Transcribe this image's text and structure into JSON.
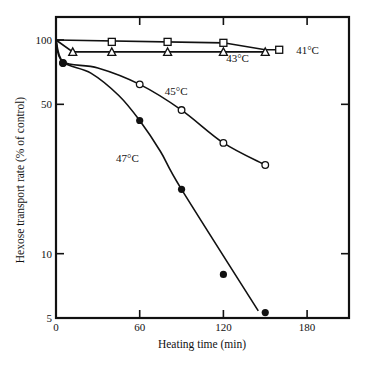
{
  "chart_data": {
    "type": "line",
    "title": "",
    "xlabel": "Heating time (min)",
    "ylabel": "Hexose transport rate (% of control)",
    "xscale": "linear",
    "yscale": "log",
    "xlim": [
      0,
      210
    ],
    "ylim": [
      5,
      130
    ],
    "x_ticks": [
      0,
      60,
      120,
      180
    ],
    "y_ticks": [
      5,
      10,
      50,
      100
    ],
    "x_tick_labels": [
      "0",
      "60",
      "120",
      "180"
    ],
    "y_tick_labels": [
      "5",
      "10",
      "50",
      "100"
    ],
    "grid": false,
    "legend": "inline labels next to curves",
    "series": [
      {
        "name": "41°C",
        "marker": "open-square",
        "x": [
          0,
          40,
          80,
          120,
          160
        ],
        "values": [
          100,
          98,
          98,
          97,
          90
        ],
        "line_points": [
          [
            0,
            100
          ],
          [
            120,
            97
          ],
          [
            150,
            90
          ],
          [
            160,
            90
          ]
        ]
      },
      {
        "name": "43°C",
        "marker": "open-triangle",
        "x": [
          0,
          12,
          40,
          80,
          120,
          150
        ],
        "values": [
          100,
          88,
          88,
          88,
          88,
          88
        ],
        "line_points": [
          [
            0,
            100
          ],
          [
            12,
            88
          ],
          [
            150,
            88
          ]
        ]
      },
      {
        "name": "45°C",
        "marker": "open-circle",
        "x": [
          5,
          60,
          90,
          120,
          150
        ],
        "values": [
          78,
          62,
          47,
          33,
          26
        ],
        "line_points": [
          [
            0,
            100
          ],
          [
            5,
            79
          ],
          [
            30,
            74
          ],
          [
            60,
            62
          ],
          [
            90,
            47
          ],
          [
            120,
            33
          ],
          [
            150,
            26
          ]
        ]
      },
      {
        "name": "47°C",
        "marker": "filled-circle",
        "x": [
          5,
          60,
          90,
          120,
          150
        ],
        "values": [
          78,
          42,
          20,
          8,
          5.3
        ],
        "line_points": [
          [
            0,
            100
          ],
          [
            5,
            79
          ],
          [
            25,
            70
          ],
          [
            45,
            55
          ],
          [
            60,
            42
          ],
          [
            75,
            30
          ],
          [
            90,
            20
          ],
          [
            145,
            5.4
          ]
        ]
      }
    ],
    "annotations": [
      {
        "text": "41°C",
        "x": 165,
        "y": 90
      },
      {
        "text": "43°C",
        "x": 122,
        "y": 82
      },
      {
        "text": "45°C",
        "x": 78,
        "y": 55
      },
      {
        "text": "47°C",
        "x": 43,
        "y": 27
      }
    ]
  },
  "plot": {
    "left": 56,
    "right": 349,
    "top": 17,
    "bottom": 318,
    "x_px_per_unit": 1.395,
    "y_log_top_value": 130
  }
}
